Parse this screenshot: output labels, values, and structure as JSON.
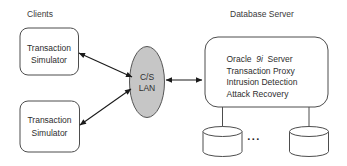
{
  "diagram": {
    "left_section": {
      "title": "Clients",
      "boxes": [
        {
          "line1": "Transaction",
          "line2": "Simulator"
        },
        {
          "line1": "Transaction",
          "line2": "Simulator"
        }
      ]
    },
    "network": {
      "line1": "C/S",
      "line2": "LAN"
    },
    "right_section": {
      "title": "Database Server",
      "server_box": {
        "oracle_line": {
          "prefix": "Oracle",
          "version": "9i",
          "suffix": "Server"
        },
        "line2": "Transaction Proxy",
        "line3": "Intrusion Detection",
        "line4": "Attack Recovery"
      },
      "ellipsis": "..."
    },
    "colors": {
      "lan_fill": "#c6c6c6",
      "shape_stroke": "#4d4d4d",
      "arrow_color": "#1a1a1a",
      "text_color": "#333333",
      "background": "#ffffff"
    }
  }
}
